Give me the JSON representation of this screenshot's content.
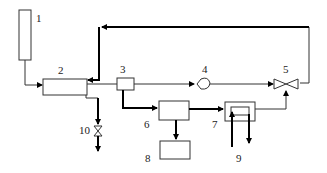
{
  "diagram": {
    "type": "process-flow-schematic",
    "components": [
      {
        "id": "1",
        "label": "1",
        "shape": "tall-rectangle"
      },
      {
        "id": "2",
        "label": "2",
        "shape": "rectangle"
      },
      {
        "id": "3",
        "label": "3",
        "shape": "small-rectangle"
      },
      {
        "id": "4",
        "label": "4",
        "shape": "pump-symbol"
      },
      {
        "id": "5",
        "label": "5",
        "shape": "three-way-valve"
      },
      {
        "id": "6",
        "label": "6",
        "shape": "rectangle"
      },
      {
        "id": "7",
        "label": "7",
        "shape": "heat-exchanger"
      },
      {
        "id": "8",
        "label": "8",
        "shape": "rectangle"
      },
      {
        "id": "9",
        "label": "9",
        "shape": "inlet-outlet-pair"
      },
      {
        "id": "10",
        "label": "10",
        "shape": "valve"
      }
    ],
    "connections": [
      {
        "from": "1",
        "to": "2"
      },
      {
        "from": "2",
        "to": "3"
      },
      {
        "from": "3",
        "to": "4"
      },
      {
        "from": "4",
        "to": "5"
      },
      {
        "from": "5",
        "to": "2",
        "note": "recycle loop over top"
      },
      {
        "from": "3",
        "to": "6"
      },
      {
        "from": "6",
        "to": "7"
      },
      {
        "from": "6",
        "to": "8"
      },
      {
        "from": "7",
        "to": "5"
      },
      {
        "from": "9",
        "to": "7",
        "note": "coolant in/out"
      },
      {
        "from": "2",
        "to": "10"
      }
    ]
  }
}
